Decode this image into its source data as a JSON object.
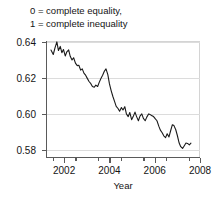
{
  "caption": {
    "line1": "0 = complete equality,",
    "line2": "1 = complete inequality"
  },
  "axes": {
    "xlabel": "Year",
    "ylabel": "",
    "y_ticks": [
      "0.64",
      "0.62",
      "0.60",
      "0.58"
    ],
    "x_ticks": [
      "2002",
      "2004",
      "2006",
      "2008"
    ]
  },
  "colors": {
    "line": "#1a1a1a",
    "grid": "#dcdcdc",
    "axis": "#5a5a5a",
    "background": "#ffffff"
  },
  "chart_data": {
    "type": "line",
    "title": "",
    "subtitle": "0 = complete equality, 1 = complete inequality",
    "xlabel": "Year",
    "ylabel": "",
    "xlim": [
      2001.2,
      2008.0
    ],
    "ylim": [
      0.5755,
      0.6405
    ],
    "yticks": [
      0.58,
      0.6,
      0.62,
      0.64
    ],
    "xticks": [
      2002,
      2004,
      2006,
      2008
    ],
    "xticks_minor": [
      2001.5,
      2002.5,
      2003.5,
      2004.5,
      2005.5,
      2006.5,
      2007.5
    ],
    "grid": "horizontal",
    "legend": "none",
    "series": [
      {
        "name": "Gini coefficient",
        "x": [
          2001.42,
          2001.52,
          2001.6,
          2001.68,
          2001.75,
          2001.83,
          2001.9,
          2001.97,
          2002.05,
          2002.12,
          2002.2,
          2002.27,
          2002.35,
          2002.42,
          2002.5,
          2002.58,
          2002.65,
          2002.73,
          2002.8,
          2002.88,
          2002.95,
          2003.03,
          2003.1,
          2003.18,
          2003.25,
          2003.33,
          2003.4,
          2003.48,
          2003.55,
          2003.63,
          2003.7,
          2003.78,
          2003.85,
          2003.93,
          2004.0,
          2004.08,
          2004.15,
          2004.23,
          2004.3,
          2004.38,
          2004.45,
          2004.53,
          2004.6,
          2004.68,
          2004.75,
          2004.83,
          2004.9,
          2004.98,
          2005.05,
          2005.13,
          2005.2,
          2005.28,
          2005.35,
          2005.43,
          2005.5,
          2005.58,
          2005.65,
          2005.73,
          2005.8,
          2005.88,
          2005.95,
          2006.03,
          2006.1,
          2006.18,
          2006.25,
          2006.33,
          2006.4,
          2006.48,
          2006.55,
          2006.63,
          2006.7,
          2006.78,
          2006.85,
          2006.93,
          2007.0,
          2007.08,
          2007.15,
          2007.23,
          2007.3,
          2007.38,
          2007.45,
          2007.53,
          2007.6
        ],
        "y": [
          0.6355,
          0.633,
          0.6368,
          0.64,
          0.6352,
          0.6375,
          0.634,
          0.6358,
          0.6322,
          0.6345,
          0.6356,
          0.632,
          0.63,
          0.6312,
          0.6282,
          0.6268,
          0.627,
          0.6243,
          0.625,
          0.6225,
          0.6215,
          0.6196,
          0.618,
          0.6168,
          0.6152,
          0.6148,
          0.616,
          0.6152,
          0.6175,
          0.6198,
          0.6215,
          0.6238,
          0.625,
          0.6218,
          0.6168,
          0.6128,
          0.6098,
          0.6068,
          0.6042,
          0.603,
          0.6015,
          0.6035,
          0.6022,
          0.604,
          0.6,
          0.5985,
          0.6008,
          0.5968,
          0.5985,
          0.601,
          0.5985,
          0.5962,
          0.5988,
          0.6,
          0.5975,
          0.5962,
          0.5982,
          0.6,
          0.5996,
          0.599,
          0.5985,
          0.5972,
          0.5962,
          0.5932,
          0.591,
          0.5895,
          0.5878,
          0.5868,
          0.589,
          0.5872,
          0.5905,
          0.594,
          0.5935,
          0.5912,
          0.588,
          0.5838,
          0.5818,
          0.5808,
          0.5822,
          0.5838,
          0.5836,
          0.5828,
          0.5838
        ]
      }
    ]
  }
}
